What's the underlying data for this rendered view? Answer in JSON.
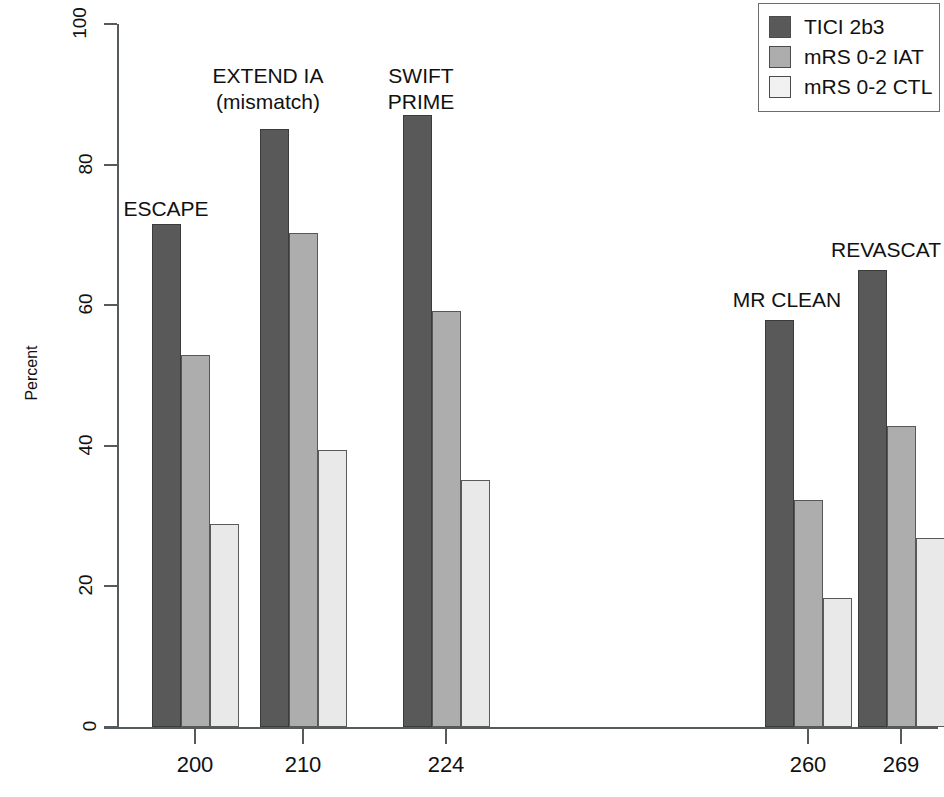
{
  "chart_data": {
    "type": "bar",
    "title": "",
    "xlabel": "",
    "ylabel": "Percent",
    "ylim": [
      0,
      100
    ],
    "ytick_values": [
      0,
      20,
      40,
      60,
      80,
      100
    ],
    "ytick_labels": [
      "0",
      "20",
      "40",
      "60",
      "80",
      "100"
    ],
    "grid": false,
    "legend_position": "top-right",
    "categories": [
      "200",
      "210",
      "224",
      "260",
      "269"
    ],
    "group_labels": [
      "ESCAPE",
      "EXTEND IA\n(mismatch)",
      "SWIFT\nPRIME",
      "MR CLEAN",
      "REVASCAT"
    ],
    "series": [
      {
        "name": "TICI 2b3",
        "color": "#595959",
        "values": [
          71.6,
          85.1,
          87.1,
          57.9,
          65.0
        ]
      },
      {
        "name": "mRS 0-2 IAT",
        "color": "#adadad",
        "values": [
          52.9,
          70.3,
          59.2,
          32.3,
          42.8
        ]
      },
      {
        "name": "mRS 0-2 CTL",
        "color": "#e9e9e9",
        "values": [
          28.9,
          39.4,
          35.1,
          18.3,
          26.9
        ]
      }
    ],
    "bars": [
      {
        "group": 0,
        "series": 0,
        "x": 152,
        "width": 29,
        "value": 71.6
      },
      {
        "group": 0,
        "series": 1,
        "x": 181,
        "width": 29,
        "value": 52.9
      },
      {
        "group": 0,
        "series": 2,
        "x": 210,
        "width": 29,
        "value": 28.9
      },
      {
        "group": 1,
        "series": 0,
        "x": 260,
        "width": 29,
        "value": 85.1
      },
      {
        "group": 1,
        "series": 1,
        "x": 289,
        "width": 29,
        "value": 70.3
      },
      {
        "group": 1,
        "series": 2,
        "x": 318,
        "width": 29,
        "value": 39.4
      },
      {
        "group": 2,
        "series": 0,
        "x": 403,
        "width": 29,
        "value": 87.1
      },
      {
        "group": 2,
        "series": 1,
        "x": 432,
        "width": 29,
        "value": 59.2
      },
      {
        "group": 2,
        "series": 2,
        "x": 461,
        "width": 29,
        "value": 35.1
      },
      {
        "group": 3,
        "series": 0,
        "x": 765,
        "width": 29,
        "value": 57.9
      },
      {
        "group": 3,
        "series": 1,
        "x": 794,
        "width": 29,
        "value": 32.3
      },
      {
        "group": 3,
        "series": 2,
        "x": 823,
        "width": 29,
        "value": 18.3
      },
      {
        "group": 4,
        "series": 0,
        "x": 858,
        "width": 29,
        "value": 65.0
      },
      {
        "group": 4,
        "series": 1,
        "x": 887,
        "width": 29,
        "value": 42.8
      },
      {
        "group": 4,
        "series": 2,
        "x": 916,
        "width": 29,
        "value": 26.9
      }
    ],
    "xtick_positions": [
      195,
      303,
      446,
      808,
      901
    ],
    "group_label_positions": [
      {
        "x": 166,
        "y": 196
      },
      {
        "x": 268,
        "y": 63
      },
      {
        "x": 421,
        "y": 63
      },
      {
        "x": 787,
        "y": 287
      },
      {
        "x": 886,
        "y": 237
      }
    ]
  },
  "legend": {
    "items": [
      {
        "label": "TICI 2b3"
      },
      {
        "label": "mRS 0-2 IAT"
      },
      {
        "label": "mRS 0-2 CTL"
      }
    ]
  },
  "axis": {
    "y_title": "Percent"
  }
}
